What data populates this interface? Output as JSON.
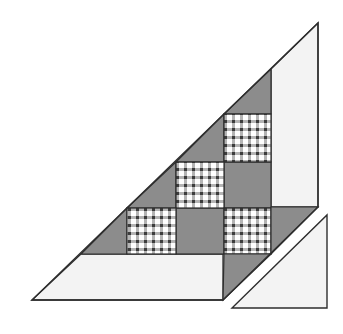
{
  "diagram": {
    "type": "quilt-block-assembly",
    "colors": {
      "background": "#ffffff",
      "light_fabric": "#f3f3f3",
      "dark_fabric": "#8c8c8c",
      "outline": "#2e2e2e",
      "gingham_dark": "#3c3c3c",
      "gingham_mid": "#9a9a9a",
      "gingham_light": "#ffffff"
    },
    "pieces": {
      "plaid_squares": 3,
      "dark_squares": 2,
      "dark_setting_triangles": 4,
      "light_border_strips": 2,
      "separate_corner_triangle": 1
    }
  }
}
